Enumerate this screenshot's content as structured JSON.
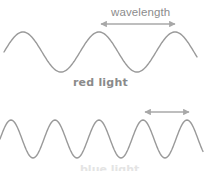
{
  "diagram": {
    "wavelength_label": "wavelength",
    "red_wave_label": "red light",
    "blue_wave_label": "blue light",
    "colors": {
      "wave_stroke": "#9a9a9a",
      "arrow_stroke": "#a8a8a8",
      "text": "#8a8a8a",
      "background": "#ffffff"
    },
    "red_wave": {
      "center_y": 52,
      "amplitude": 20,
      "period_px": 76,
      "x_start": 4,
      "x_end": 197,
      "first_crest_x": 23,
      "arrow": {
        "x1": 101,
        "x2": 175,
        "y": 24
      }
    },
    "blue_wave": {
      "center_y": 139,
      "amplitude": 19,
      "period_px": 44,
      "x_start": 0,
      "x_end": 203,
      "first_crest_x": 11,
      "arrow": {
        "x1": 145,
        "x2": 189,
        "y": 112
      }
    }
  }
}
